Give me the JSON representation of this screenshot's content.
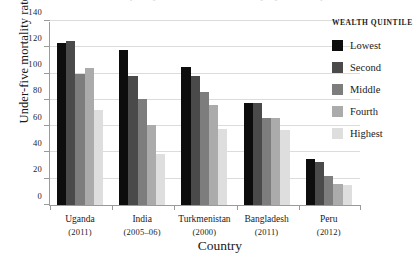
{
  "title_remnant": "Inequality in under-five mortality by wealth quintile",
  "axes": {
    "ylabel": "Under-five mortality rate",
    "xlabel": "Country",
    "yticks": [
      0,
      20,
      40,
      60,
      80,
      100,
      120,
      140
    ],
    "ylim": [
      0,
      140
    ],
    "grid": true
  },
  "legend": {
    "title": "WEALTH QUINTILE",
    "position": "right",
    "items": [
      {
        "label": "Lowest",
        "color": "#0d0d0d"
      },
      {
        "label": "Second",
        "color": "#4a4a4a"
      },
      {
        "label": "Middle",
        "color": "#7d7d7d"
      },
      {
        "label": "Fourth",
        "color": "#ababab"
      },
      {
        "label": "Highest",
        "color": "#dedede"
      }
    ]
  },
  "chart_data": {
    "type": "bar",
    "title": "",
    "xlabel": "Country",
    "ylabel": "Under-five mortality rate",
    "ylim": [
      0,
      140
    ],
    "yticks": [
      0,
      20,
      40,
      60,
      80,
      100,
      120,
      140
    ],
    "grid": true,
    "legend_title": "WEALTH QUINTILE",
    "legend_position": "right",
    "categories": [
      "Uganda",
      "India",
      "Turkmenistan",
      "Bangladesh",
      "Peru"
    ],
    "category_years": [
      "(2011)",
      "(2005–06)",
      "(2000)",
      "(2011)",
      "(2012)"
    ],
    "series": [
      {
        "name": "Lowest",
        "color": "#0d0d0d",
        "values": [
          123,
          118,
          105,
          78,
          35
        ]
      },
      {
        "name": "Second",
        "color": "#4a4a4a",
        "values": [
          125,
          98,
          98,
          78,
          33
        ]
      },
      {
        "name": "Middle",
        "color": "#7d7d7d",
        "values": [
          100,
          81,
          86,
          66,
          22
        ]
      },
      {
        "name": "Fourth",
        "color": "#ababab",
        "values": [
          104,
          61,
          76,
          66,
          16
        ]
      },
      {
        "name": "Highest",
        "color": "#dedede",
        "values": [
          72,
          39,
          58,
          57,
          15
        ]
      }
    ]
  }
}
